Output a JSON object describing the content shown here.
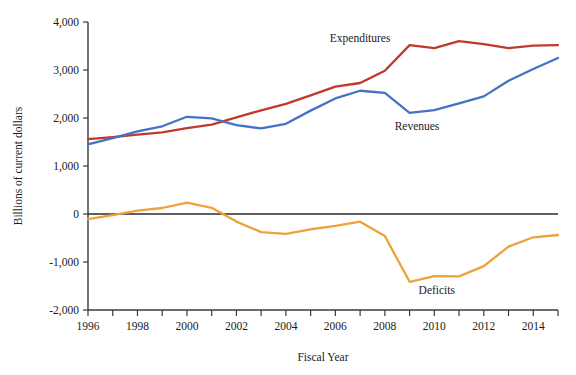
{
  "chart_data": {
    "type": "line",
    "title": "",
    "xlabel": "Fiscal Year",
    "ylabel": "Billions of current dollars",
    "xlim": [
      1996,
      2015
    ],
    "ylim": [
      -2000,
      4000
    ],
    "grid": false,
    "legend_position": "inline-annotations",
    "x": [
      1996,
      1997,
      1998,
      1999,
      2000,
      2001,
      2002,
      2003,
      2004,
      2005,
      2006,
      2007,
      2008,
      2009,
      2010,
      2011,
      2012,
      2013,
      2014,
      2015
    ],
    "xtick_values": [
      1996,
      1998,
      2000,
      2002,
      2004,
      2006,
      2008,
      2010,
      2012,
      2014
    ],
    "xtick_labels": [
      "1996",
      "1998",
      "2000",
      "2002",
      "2004",
      "2006",
      "2008",
      "2010",
      "2012",
      "2014"
    ],
    "xtick_minor_values": [
      1997,
      1999,
      2001,
      2003,
      2005,
      2007,
      2009,
      2011,
      2013,
      2015
    ],
    "ytick_values": [
      -2000,
      -1000,
      0,
      1000,
      2000,
      3000,
      4000
    ],
    "ytick_labels": [
      "-2,000",
      "-1,000",
      "0",
      "1,000",
      "2,000",
      "3,000",
      "4,000"
    ],
    "series": [
      {
        "name": "Expenditures",
        "color": "#C0392B",
        "label_text": "Expenditures",
        "label_x": 2007.0,
        "label_y": 3580,
        "values": [
          1560,
          1601,
          1652,
          1702,
          1789,
          1863,
          2011,
          2160,
          2293,
          2472,
          2655,
          2729,
          2983,
          3518,
          3457,
          3603,
          3537,
          3455,
          3506,
          3520
        ]
      },
      {
        "name": "Revenues",
        "color": "#4472C4",
        "label_text": "Revenues",
        "label_x": 2009.3,
        "label_y": 1760,
        "values": [
          1453,
          1579,
          1722,
          1827,
          2025,
          1991,
          1853,
          1782,
          1880,
          2154,
          2407,
          2568,
          2524,
          2105,
          2163,
          2304,
          2450,
          2775,
          3021,
          3250
        ]
      },
      {
        "name": "Deficits",
        "color": "#EFA13C",
        "label_text": "Deficits",
        "label_x": 2010.1,
        "label_y": -1670,
        "values": [
          -107,
          -22,
          70,
          125,
          236,
          128,
          -158,
          -378,
          -413,
          -318,
          -248,
          -161,
          -459,
          -1413,
          -1294,
          -1299,
          -1087,
          -680,
          -485,
          -438
        ]
      }
    ],
    "zero_line": 0,
    "colors": {
      "expenditures": "#C0392B",
      "revenues": "#4472C4",
      "deficits": "#EFA13C",
      "axis": "#3a3a3a",
      "background": "#ffffff"
    }
  }
}
